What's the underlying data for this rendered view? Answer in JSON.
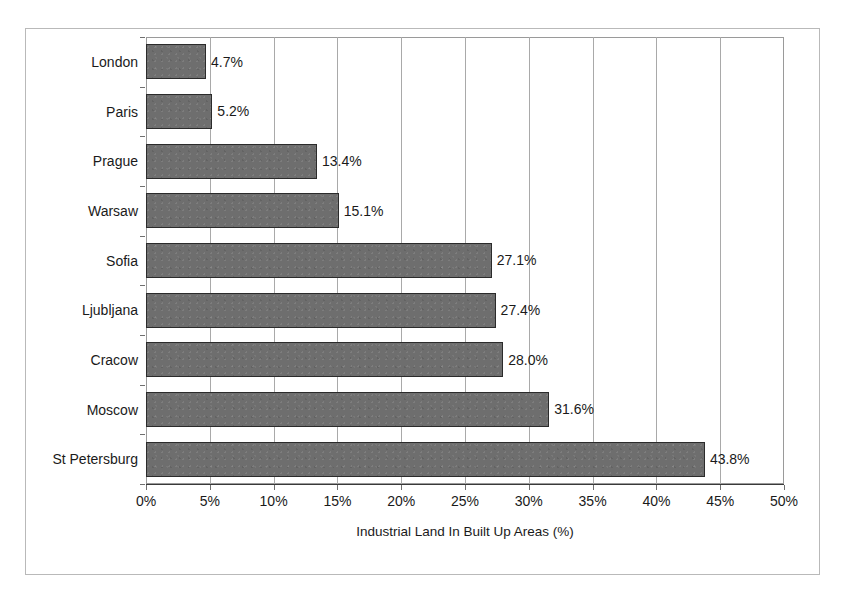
{
  "chart_data": {
    "type": "bar",
    "orientation": "horizontal",
    "title": "",
    "xlabel": "Industrial Land In Built Up Areas (%)",
    "ylabel": "",
    "categories": [
      "London",
      "Paris",
      "Prague",
      "Warsaw",
      "Sofia",
      "Ljubljana",
      "Cracow",
      "Moscow",
      "St Petersburg"
    ],
    "values": [
      4.7,
      5.2,
      13.4,
      15.1,
      27.1,
      27.4,
      28.0,
      31.6,
      43.8
    ],
    "value_labels": [
      "4.7%",
      "5.2%",
      "13.4%",
      "15.1%",
      "27.1%",
      "27.4%",
      "28.0%",
      "31.6%",
      "43.8%"
    ],
    "xlim": [
      0,
      50
    ],
    "xticks": [
      0,
      5,
      10,
      15,
      20,
      25,
      30,
      35,
      40,
      45,
      50
    ],
    "xtick_labels": [
      "0%",
      "5%",
      "10%",
      "15%",
      "20%",
      "25%",
      "30%",
      "35%",
      "40%",
      "45%",
      "50%"
    ],
    "grid": "vertical",
    "legend": "none",
    "series_name": "Industrial Land In Built Up Areas (%)",
    "bar_color": "#6e6e6e",
    "bar_border_color": "#2b2b2b",
    "gridline_color": "#a9a9a9",
    "axis_color": "#3a3a3a",
    "frame_color": "#b9b9b9",
    "background_color": "#ffffff"
  }
}
